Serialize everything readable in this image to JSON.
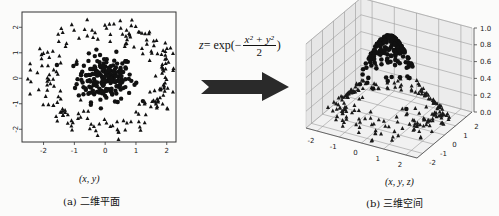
{
  "figure": {
    "formula": {
      "lhs": "z",
      "eq": " = exp(−",
      "numerator": "x² + y²",
      "denominator": "2",
      "close": ")"
    },
    "arrow_color": "#2a2a2a",
    "left_panel": {
      "axis_label": "(x, y)",
      "caption": "(a)  二维平面"
    },
    "right_panel": {
      "axis_label": "(x, y, z)",
      "caption": "(b)  三维空间"
    }
  },
  "chart_data": [
    {
      "type": "scatter",
      "title": "",
      "caption": "(a) 二维平面",
      "xlabel": "(x, y)",
      "ylabel": "",
      "xlim": [
        -2.7,
        2.3
      ],
      "ylim": [
        -2.5,
        2.6
      ],
      "xticks": [
        -2,
        -1,
        0,
        1,
        2
      ],
      "yticks": [
        2,
        1,
        0,
        -1,
        -2
      ],
      "xtick_labels": [
        "-2",
        "-1",
        "0",
        "1",
        "2"
      ],
      "ytick_labels": [
        "2",
        "1",
        "0",
        "-1",
        "-2"
      ],
      "grid": false,
      "series": [
        {
          "name": "inner cluster",
          "marker": "circle",
          "color": "#111111",
          "distribution": "gaussian",
          "center": [
            0,
            0
          ],
          "radius_sd": 0.45,
          "count": 200
        },
        {
          "name": "outer ring",
          "marker": "triangle",
          "color": "#111111",
          "distribution": "ring",
          "center": [
            0,
            0
          ],
          "radius_mean": 2.0,
          "radius_sd": 0.25,
          "count": 200
        }
      ]
    },
    {
      "type": "scatter3d",
      "caption": "(b) 三维空间",
      "xlabel": "(x, y, z)",
      "xlim": [
        -2.5,
        2.5
      ],
      "ylim": [
        -2.5,
        2.5
      ],
      "zlim": [
        0.0,
        1.0
      ],
      "xticks": [
        -2,
        -1,
        0,
        1,
        2
      ],
      "yticks": [
        -2,
        -1,
        0,
        1,
        2
      ],
      "zticks": [
        0.0,
        0.2,
        0.4,
        0.6,
        0.8,
        1.0
      ],
      "xtick_labels": [
        "-2",
        "-1",
        "0",
        "1",
        "2"
      ],
      "ytick_labels": [
        "-2",
        "-1",
        "0",
        "1",
        "2"
      ],
      "ztick_labels": [
        "0.0",
        "0.2",
        "0.4",
        "0.6",
        "0.8",
        "1.0"
      ],
      "z_function": "z = exp(-(x^2 + y^2)/2)",
      "grid": true,
      "series": [
        {
          "name": "inner cluster (lifted)",
          "marker": "circle",
          "z_range": [
            0.6,
            1.0
          ]
        },
        {
          "name": "outer ring (low)",
          "marker": "triangle",
          "z_range": [
            0.0,
            0.25
          ]
        }
      ]
    }
  ]
}
